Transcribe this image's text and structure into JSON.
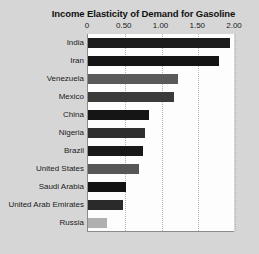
{
  "chart_data": {
    "type": "bar",
    "orientation": "horizontal",
    "title": "Income Elasticity of Demand for Gasoline",
    "xlabel": "",
    "ylabel": "",
    "xlim": [
      0,
      2.0
    ],
    "xticks": [
      "0",
      "0.50",
      "1.00",
      "1.50",
      "2.00"
    ],
    "xtick_values": [
      0,
      0.5,
      1.0,
      1.5,
      2.0
    ],
    "grid": "vertical-dotted",
    "legend": "none",
    "categories": [
      "India",
      "Iran",
      "Venezuela",
      "Mexico",
      "China",
      "Nigeria",
      "Brazil",
      "United States",
      "Saudi Arabia",
      "United Arab Emirates",
      "Russia"
    ],
    "values": [
      1.93,
      1.78,
      1.23,
      1.17,
      0.83,
      0.77,
      0.75,
      0.7,
      0.52,
      0.47,
      0.26
    ],
    "bar_colors": [
      "#1c1c1c",
      "#141414",
      "#5a5a5a",
      "#3a3a3a",
      "#151515",
      "#2e2e2e",
      "#181818",
      "#565656",
      "#121212",
      "#2a2a2a",
      "#b0b0b0"
    ]
  },
  "colors": {
    "page_background": "#d6d6d6",
    "plot_background": "#fdfdfd",
    "axis_line": "#8a8a8a",
    "gridline": "#b4b4b4",
    "text": "#1a1a1a"
  }
}
